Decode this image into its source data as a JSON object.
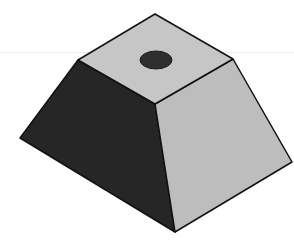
{
  "figure": {
    "view": "isometric",
    "colors": {
      "background": "#ffffff",
      "top_face": "#c6c6c6",
      "left_face": "#262626",
      "right_face": "#bdbdbd",
      "hole": "#2f2f2f",
      "edge": "#111111",
      "scanline": "#ececec"
    },
    "vertices": {
      "top_back": [
        155,
        14
      ],
      "top_left": [
        78,
        60
      ],
      "top_right": [
        233,
        59
      ],
      "top_front": [
        155,
        104
      ],
      "bottom_left": [
        20,
        138
      ],
      "bottom_front": [
        175,
        232
      ],
      "bottom_right": [
        292,
        162
      ]
    },
    "hole": {
      "cx": 156,
      "cy": 60,
      "rx": 16,
      "ry": 9
    }
  }
}
